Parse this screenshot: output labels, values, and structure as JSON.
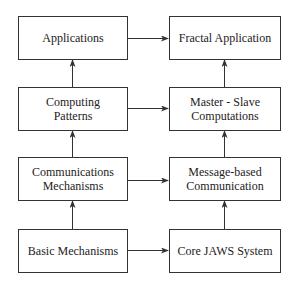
{
  "diagram": {
    "left_column": [
      {
        "id": "applications",
        "label": "Applications"
      },
      {
        "id": "computing-patterns",
        "label": "Computing\nPatterns"
      },
      {
        "id": "communications-mechanisms",
        "label": "Communications\nMechanisms"
      },
      {
        "id": "basic-mechanisms",
        "label": "Basic Mechanisms"
      }
    ],
    "right_column": [
      {
        "id": "fractal-application",
        "label": "Fractal Application"
      },
      {
        "id": "master-slave-computations",
        "label": "Master - Slave\nComputations"
      },
      {
        "id": "message-based-communication",
        "label": "Message-based\nCommunication"
      },
      {
        "id": "core-jaws-system",
        "label": "Core JAWS System"
      }
    ],
    "edges": [
      {
        "from": "computing-patterns",
        "to": "applications",
        "type": "arrow-up"
      },
      {
        "from": "communications-mechanisms",
        "to": "computing-patterns",
        "type": "arrow-up"
      },
      {
        "from": "basic-mechanisms",
        "to": "communications-mechanisms",
        "type": "arrow-up"
      },
      {
        "from": "master-slave-computations",
        "to": "fractal-application",
        "type": "arrow-up"
      },
      {
        "from": "message-based-communication",
        "to": "master-slave-computations",
        "type": "arrow-up"
      },
      {
        "from": "core-jaws-system",
        "to": "message-based-communication",
        "type": "arrow-up"
      },
      {
        "from": "applications",
        "to": "fractal-application",
        "type": "bidirectional"
      },
      {
        "from": "computing-patterns",
        "to": "master-slave-computations",
        "type": "bidirectional"
      },
      {
        "from": "communications-mechanisms",
        "to": "message-based-communication",
        "type": "bidirectional"
      },
      {
        "from": "basic-mechanisms",
        "to": "core-jaws-system",
        "type": "bidirectional"
      }
    ]
  }
}
